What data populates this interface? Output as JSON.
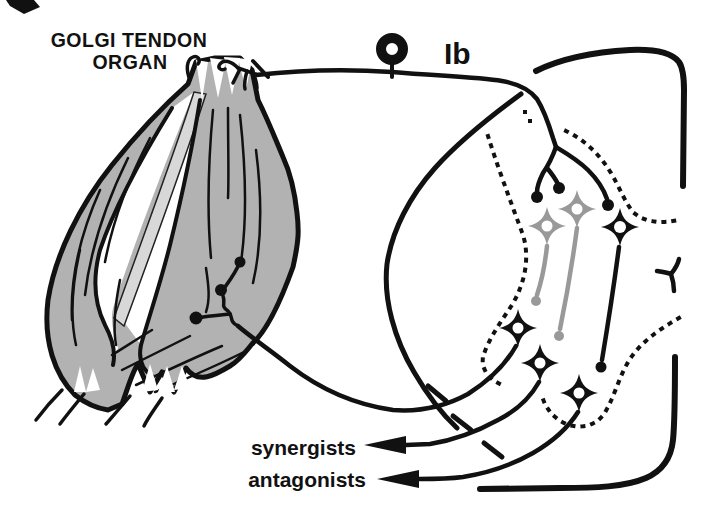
{
  "labels": {
    "title_line1": "GOLGI TENDON",
    "title_line2": "ORGAN",
    "afferent": "Ib",
    "target_synergists": "synergists",
    "target_antagonists": "antagonists"
  },
  "colors": {
    "ink": "#111111",
    "muscle_fill": "#b2b2b2",
    "tendon_strip": "#d8d8d8",
    "inhibitory_gray": "#999999",
    "background": "#ffffff"
  }
}
